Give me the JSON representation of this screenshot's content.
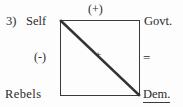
{
  "figure": {
    "item_number": "3)",
    "nodes": {
      "top_left": "Self",
      "top_right": "Govt.",
      "bottom_left": "Rebels",
      "bottom_right": "Dem."
    },
    "edge_signs": {
      "top": "(+)",
      "left": "(-)",
      "right": "=",
      "diagonal": "+"
    },
    "colors": {
      "ink": "#3a3a3a",
      "text": "#2b2b2b",
      "background": "#fdfdfd"
    }
  }
}
